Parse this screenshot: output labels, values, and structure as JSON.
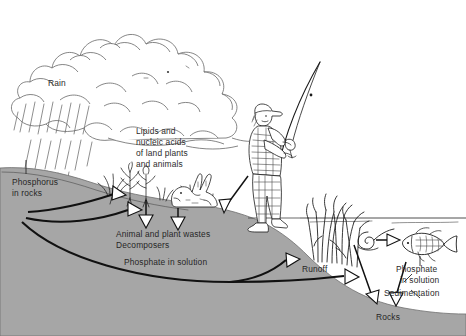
{
  "diagram": {
    "type": "science-illustration",
    "canvas": {
      "width": 466,
      "height": 336
    },
    "colors": {
      "ground_fill": "#a6a6a6",
      "ground_outline": "#6f6f6f",
      "ink": "#1a1a1a",
      "label_text": "#2b2b2b",
      "background": "#ffffff",
      "cloud_outline": "#5d5d5d"
    },
    "labels": {
      "rain": "Rain",
      "lipids_line1": "Lipids and",
      "lipids_line2": "nucleic acids",
      "lipids_line3": "of land plants",
      "lipids_line4": "and animals",
      "phosphorus_rocks_line1": "Phosphorus",
      "phosphorus_rocks_line2": "in rocks",
      "wastes_line1": "Animal and plant wastes",
      "wastes_line2": "Decomposers",
      "phosphate_solution_land": "Phosphate in solution",
      "runoff": "Runoff",
      "phosphate_solution_water_line1": "Phosphate",
      "phosphate_solution_water_line2": "in solution",
      "sedimentation": "Sedimentation",
      "rocks": "Rocks"
    },
    "elements": {
      "cloud": "cumulus-cloud",
      "rainfall": "rain-streaks",
      "hillside": "sloping-ground-cross-section",
      "grass_patch": "land-plants",
      "rabbit": "rabbit-animal",
      "angler": "fisherman-with-rod",
      "reeds": "aquatic-plants",
      "snail": "water-snail",
      "fish": "fish",
      "water_surface": "waterline"
    },
    "flows": [
      {
        "name": "weathering-to-plants",
        "from": "phosphorus-in-rocks",
        "to": "land-plants",
        "style": "curved-solid"
      },
      {
        "name": "weathering-to-soil",
        "from": "phosphorus-in-rocks",
        "to": "soil",
        "style": "curved-solid"
      },
      {
        "name": "phosphate-in-solution-to-water",
        "from": "phosphorus-in-rocks",
        "to": "water-body",
        "style": "long-curve"
      },
      {
        "name": "plants-to-wastes",
        "from": "land-plants",
        "to": "decomposers",
        "style": "straight-down"
      },
      {
        "name": "animals-to-wastes",
        "from": "rabbit",
        "to": "decomposers",
        "style": "straight-down"
      },
      {
        "name": "angler-uptake",
        "from": "fisherman",
        "to": "soil",
        "style": "diagonal"
      },
      {
        "name": "runoff-to-water",
        "from": "hillside",
        "to": "water-body",
        "style": "curved-solid"
      },
      {
        "name": "solution-to-water",
        "from": "soil-solution",
        "to": "water-body",
        "style": "straight"
      },
      {
        "name": "snail-to-fish",
        "from": "aquatic-producers",
        "to": "fish",
        "style": "straight"
      },
      {
        "name": "sedimentation-to-rocks",
        "from": "water-body",
        "to": "rocks",
        "style": "diagonal-down"
      },
      {
        "name": "sediment-settling",
        "from": "fish",
        "to": "rocks",
        "style": "diagonal-down"
      }
    ]
  }
}
